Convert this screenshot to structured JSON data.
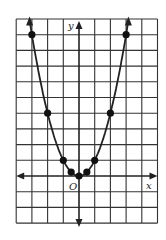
{
  "chart_data": {
    "type": "line",
    "title": "",
    "xlabel": "x",
    "ylabel": "y",
    "origin_label": "O",
    "function": "y = x^2",
    "xlim": [
      -4,
      5
    ],
    "ylim": [
      -3,
      10
    ],
    "grid": true,
    "grid_step": 1,
    "points": [
      {
        "x": -3,
        "y": 9
      },
      {
        "x": -2,
        "y": 4
      },
      {
        "x": -1,
        "y": 1
      },
      {
        "x": -0.5,
        "y": 0.25
      },
      {
        "x": 0,
        "y": 0
      },
      {
        "x": 0.5,
        "y": 0.25
      },
      {
        "x": 1,
        "y": 1
      },
      {
        "x": 2,
        "y": 4
      },
      {
        "x": 3,
        "y": 9
      }
    ],
    "colors": {
      "grid": "#333333",
      "curve": "#222222",
      "background": "#ffffff"
    }
  }
}
